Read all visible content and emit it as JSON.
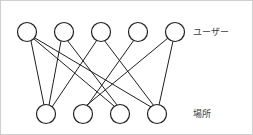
{
  "figure": {
    "kind": "bipartite-graph",
    "background_color": "#ffffff",
    "border_color": "#cfcfcf",
    "node_fill": "#ffffff",
    "node_stroke": "#1f1f1f",
    "edge_color": "#1f1f1f",
    "label_color": "#3c3c3c",
    "width": 253,
    "height": 135
  },
  "labels": {
    "top_row": "ユーザー",
    "bottom_row": "場所"
  },
  "label_positions": {
    "top": {
      "x": 192,
      "y": 31
    },
    "bottom": {
      "x": 192,
      "y": 113
    }
  },
  "nodes": {
    "radius": 9.5,
    "top": [
      {
        "id": "u1",
        "cx": 26,
        "cy": 31
      },
      {
        "id": "u2",
        "cx": 63,
        "cy": 31
      },
      {
        "id": "u3",
        "cx": 100,
        "cy": 31
      },
      {
        "id": "u4",
        "cx": 137,
        "cy": 31
      },
      {
        "id": "u5",
        "cx": 174,
        "cy": 31
      }
    ],
    "bottom": [
      {
        "id": "p1",
        "cx": 45,
        "cy": 113
      },
      {
        "id": "p2",
        "cx": 82,
        "cy": 113
      },
      {
        "id": "p3",
        "cx": 119,
        "cy": 113
      },
      {
        "id": "p4",
        "cx": 156,
        "cy": 113
      }
    ]
  },
  "edges": [
    {
      "from": "u1",
      "to": "p1",
      "x1": 30,
      "y1": 40,
      "x2": 43,
      "y2": 104
    },
    {
      "from": "u1",
      "to": "p3",
      "x1": 33,
      "y1": 38,
      "x2": 113,
      "y2": 105
    },
    {
      "from": "u1",
      "to": "p4",
      "x1": 34,
      "y1": 37,
      "x2": 150,
      "y2": 106
    },
    {
      "from": "u2",
      "to": "p1",
      "x1": 60,
      "y1": 40,
      "x2": 48,
      "y2": 104
    },
    {
      "from": "u2",
      "to": "p3",
      "x1": 66,
      "y1": 39,
      "x2": 116,
      "y2": 104
    },
    {
      "from": "u3",
      "to": "p1",
      "x1": 96,
      "y1": 39,
      "x2": 51,
      "y2": 106
    },
    {
      "from": "u3",
      "to": "p4",
      "x1": 103,
      "y1": 39,
      "x2": 153,
      "y2": 105
    },
    {
      "from": "u4",
      "to": "p2",
      "x1": 133,
      "y1": 39,
      "x2": 86,
      "y2": 105
    },
    {
      "from": "u5",
      "to": "p2",
      "x1": 167,
      "y1": 37,
      "x2": 86,
      "y2": 104
    },
    {
      "from": "u5",
      "to": "p4",
      "x1": 172,
      "y1": 40,
      "x2": 158,
      "y2": 104
    }
  ]
}
